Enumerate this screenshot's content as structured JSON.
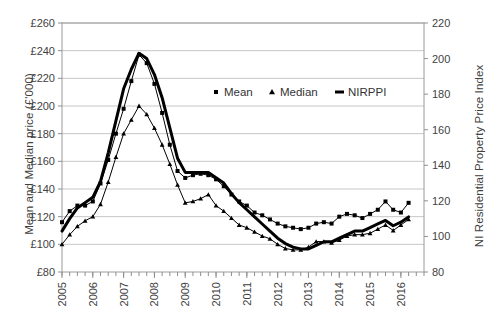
{
  "chart_data": {
    "type": "line",
    "title": "",
    "xlabel": "",
    "ylabel": "Mean and Median price (£'000)",
    "ylabel_secondary": "NI Residential Property Price Index",
    "grid": true,
    "legend_position": "inside-top-right",
    "xlim": [
      2005.0,
      2016.75
    ],
    "ylim": [
      80,
      260
    ],
    "ylim_secondary": [
      80,
      220
    ],
    "ytick_labels": [
      "£80",
      "£100",
      "£120",
      "£140",
      "£160",
      "£180",
      "£200",
      "£220",
      "£240",
      "£260"
    ],
    "ytick_values": [
      80,
      100,
      120,
      140,
      160,
      180,
      200,
      220,
      240,
      260
    ],
    "ytick_labels_secondary": [
      "80",
      "100",
      "120",
      "140",
      "160",
      "180",
      "200",
      "220"
    ],
    "ytick_values_secondary": [
      80,
      100,
      120,
      140,
      160,
      180,
      200,
      220
    ],
    "xtick_labels": [
      "2005",
      "2006",
      "2007",
      "2008",
      "2009",
      "2010",
      "2011",
      "2012",
      "2013",
      "2014",
      "2015",
      "2016"
    ],
    "xtick_values": [
      2005,
      2006,
      2007,
      2008,
      2009,
      2010,
      2011,
      2012,
      2013,
      2014,
      2015,
      2016
    ],
    "x": [
      2005.0,
      2005.25,
      2005.5,
      2005.75,
      2006.0,
      2006.25,
      2006.5,
      2006.75,
      2007.0,
      2007.25,
      2007.5,
      2007.75,
      2008.0,
      2008.25,
      2008.5,
      2008.75,
      2009.0,
      2009.25,
      2009.5,
      2009.75,
      2010.0,
      2010.25,
      2010.5,
      2010.75,
      2011.0,
      2011.25,
      2011.5,
      2011.75,
      2012.0,
      2012.25,
      2012.5,
      2012.75,
      2013.0,
      2013.25,
      2013.5,
      2013.75,
      2014.0,
      2014.25,
      2014.5,
      2014.75,
      2015.0,
      2015.25,
      2015.5,
      2015.75,
      2016.0,
      2016.25
    ],
    "series": [
      {
        "name": "Mean",
        "axis": "left",
        "marker": "square",
        "line_width": 1,
        "color": "#000000",
        "values": [
          116,
          124,
          128,
          128,
          131,
          144,
          161,
          180,
          198,
          218,
          237,
          231,
          216,
          195,
          172,
          153,
          148,
          150,
          151,
          150,
          147,
          142,
          136,
          131,
          128,
          123,
          121,
          118,
          115,
          113,
          112,
          111,
          112,
          115,
          116,
          115,
          120,
          122,
          121,
          119,
          122,
          125,
          131,
          125,
          123,
          130
        ]
      },
      {
        "name": "Median",
        "axis": "left",
        "marker": "triangle",
        "line_width": 1,
        "color": "#000000",
        "values": [
          100,
          107,
          113,
          117,
          120,
          129,
          145,
          163,
          180,
          190,
          200,
          194,
          184,
          172,
          158,
          143,
          130,
          131,
          133,
          136,
          128,
          124,
          119,
          114,
          112,
          109,
          106,
          104,
          100,
          97,
          96,
          96,
          98,
          102,
          102,
          101,
          103,
          106,
          107,
          107,
          108,
          111,
          114,
          110,
          114,
          118
        ]
      },
      {
        "name": "NIRPPI",
        "axis": "right",
        "marker": "none",
        "line_width": 3,
        "color": "#000000",
        "values": [
          103,
          110,
          116,
          119,
          122,
          131,
          147,
          165,
          183,
          194,
          203,
          200,
          191,
          178,
          161,
          144,
          136,
          136,
          136,
          136,
          133,
          130,
          124,
          119,
          115,
          111,
          107,
          103,
          99,
          96,
          94,
          93,
          93,
          95,
          97,
          97,
          99,
          101,
          103,
          103,
          105,
          107,
          109,
          106,
          108,
          111
        ]
      }
    ],
    "legend": [
      {
        "label": "Mean",
        "marker": "square"
      },
      {
        "label": "Median",
        "marker": "triangle"
      },
      {
        "label": "NIRPPI",
        "marker": "thick-line"
      }
    ]
  }
}
